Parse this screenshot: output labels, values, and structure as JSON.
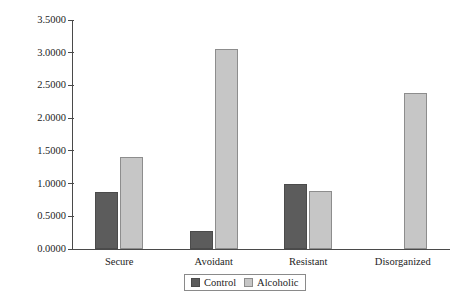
{
  "chart_data": {
    "type": "bar",
    "title": "",
    "xlabel": "",
    "ylabel": "Frequency of Marijuana Use",
    "categories": [
      "Secure",
      "Avoidant",
      "Resistant",
      "Disorganized"
    ],
    "series": [
      {
        "name": "Control",
        "color": "#5c5c5c",
        "values": [
          0.87,
          0.27,
          1.0,
          null
        ]
      },
      {
        "name": "Alcoholic",
        "color": "#c6c6c6",
        "values": [
          1.41,
          3.05,
          0.89,
          2.38
        ]
      }
    ],
    "ylim": [
      0.0,
      3.5
    ],
    "ytick_labels": [
      "3.5000",
      "3.0000",
      "2.5000",
      "2.0000",
      "1.5000",
      "1.0000",
      "0.5000",
      "0.0000"
    ],
    "ytick_values": [
      3.5,
      3.0,
      2.5,
      2.0,
      1.5,
      1.0,
      0.5,
      0.0
    ],
    "grid": false,
    "legend": {
      "position": "bottom-center",
      "entries": [
        {
          "label": "Control",
          "color": "#5c5c5c"
        },
        {
          "label": "Alcoholic",
          "color": "#c6c6c6"
        }
      ]
    }
  },
  "axis": {
    "y_title": "Frequency of Marijuana Use"
  }
}
